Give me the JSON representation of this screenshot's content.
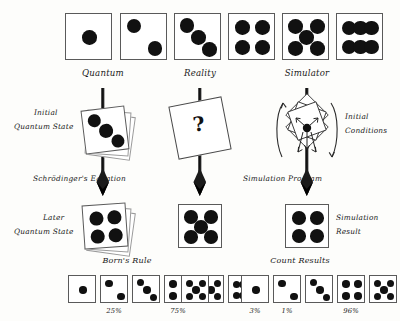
{
  "figure": {
    "background_color": "#fdfdfb",
    "ink_color": "#1a1a1a",
    "question_mark": "?"
  },
  "columns": [
    {
      "id": "quantum",
      "label": "Quantum"
    },
    {
      "id": "reality",
      "label": "Reality"
    },
    {
      "id": "simulator",
      "label": "Simulator"
    }
  ],
  "top_row": {
    "dice": [
      {
        "name": "die-face-1",
        "pips": 1
      },
      {
        "name": "die-face-2",
        "pips": 2
      },
      {
        "name": "die-face-3",
        "pips": 3
      },
      {
        "name": "die-face-4",
        "pips": 4
      },
      {
        "name": "die-face-5",
        "pips": 5
      },
      {
        "name": "die-face-6",
        "pips": 6
      }
    ]
  },
  "middle_row": {
    "left": {
      "label_line1": "Initial",
      "label_line2": "Quantum State",
      "arrow_label": "Schrödinger's Equation",
      "die_pips": 3
    },
    "center": {
      "card_text": "?"
    },
    "right": {
      "label_line1": "Initial",
      "label_line2": "Conditions",
      "arrow_label": "Simulation Program",
      "die_pips": 0
    }
  },
  "result_row": {
    "left": {
      "label_line1": "Later",
      "label_line2": "Quantum State",
      "die_pips": 4
    },
    "center": {
      "die_pips": 5
    },
    "right": {
      "label_line1": "Simulation",
      "label_line2": "Result",
      "die_pips": 4
    }
  },
  "bottom_row": {
    "left": {
      "title": "Born's Rule",
      "dice": [
        {
          "pips": 1,
          "percent": ""
        },
        {
          "pips": 2,
          "percent": "25%"
        },
        {
          "pips": 3,
          "percent": ""
        },
        {
          "pips": 4,
          "percent": "75%"
        },
        {
          "pips": 5,
          "percent": ""
        },
        {
          "pips": 6,
          "percent": ""
        }
      ]
    },
    "center": {
      "die_pips": 5
    },
    "right": {
      "title": "Count Results",
      "dice": [
        {
          "pips": 1,
          "percent": "3%"
        },
        {
          "pips": 2,
          "percent": "1%"
        },
        {
          "pips": 3,
          "percent": ""
        },
        {
          "pips": 4,
          "percent": "96%"
        },
        {
          "pips": 5,
          "percent": ""
        },
        {
          "pips": 6,
          "percent": ""
        }
      ]
    }
  }
}
